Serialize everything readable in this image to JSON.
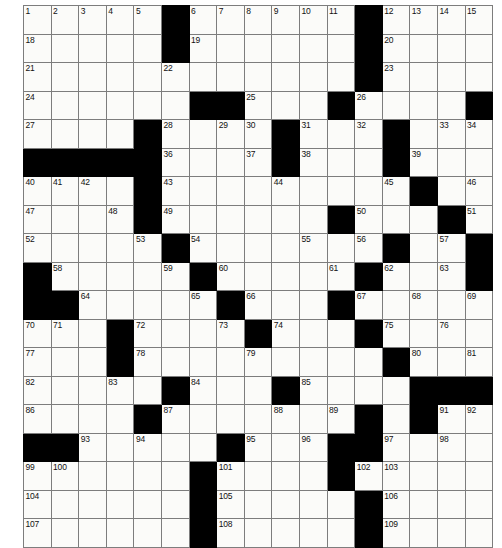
{
  "puzzle": {
    "type": "crossword-grid",
    "rows": 17,
    "cols": 17,
    "cell_size_px": 27.6,
    "colors": {
      "block": "#000000",
      "cell": "#fbfbf9",
      "grid_line": "#7d7d7d",
      "number_text": "#111111",
      "page_background": "#ffffff"
    },
    "max_number": 109,
    "grid": [
      [
        "1",
        "2",
        "3",
        "4",
        "5",
        "#",
        "6",
        "7",
        "8",
        "9",
        "10",
        "11",
        "#",
        "12",
        "13",
        "14",
        "15",
        "16",
        "17"
      ],
      [
        "18",
        "",
        "",
        "",
        "",
        "#",
        "19",
        "",
        "",
        "",
        "",
        "",
        "#",
        "20",
        "",
        "",
        "",
        "",
        ""
      ]
    ],
    "blocks": [
      [
        0,
        5
      ],
      [
        0,
        12
      ],
      [
        1,
        5
      ],
      [
        1,
        12
      ],
      [
        2,
        12
      ],
      [
        3,
        6
      ],
      [
        3,
        7
      ],
      [
        3,
        11
      ],
      [
        3,
        16
      ],
      [
        4,
        4
      ],
      [
        4,
        9
      ],
      [
        4,
        13
      ],
      [
        5,
        0
      ],
      [
        5,
        1
      ],
      [
        5,
        2
      ],
      [
        5,
        3
      ],
      [
        5,
        4
      ],
      [
        5,
        9
      ],
      [
        5,
        13
      ],
      [
        6,
        4
      ],
      [
        6,
        14
      ],
      [
        7,
        4
      ],
      [
        7,
        5
      ],
      [
        7,
        11
      ],
      [
        7,
        14
      ],
      [
        8,
        5
      ],
      [
        8,
        13
      ],
      [
        8,
        16
      ],
      [
        9,
        0
      ],
      [
        9,
        6
      ],
      [
        9,
        12
      ],
      [
        9,
        16
      ],
      [
        10,
        0
      ],
      [
        10,
        1
      ],
      [
        10,
        2
      ],
      [
        10,
        7
      ],
      [
        10,
        11
      ],
      [
        11,
        4
      ],
      [
        11,
        8
      ],
      [
        11,
        12
      ],
      [
        12,
        4
      ],
      [
        12,
        13
      ],
      [
        13,
        6
      ],
      [
        13,
        10
      ],
      [
        13,
        14
      ],
      [
        13,
        15
      ],
      [
        13,
        16
      ],
      [
        14,
        5
      ],
      [
        14,
        12
      ],
      [
        14,
        14
      ],
      [
        15,
        0
      ],
      [
        15,
        1
      ],
      [
        15,
        8
      ],
      [
        15,
        11
      ],
      [
        15,
        12
      ],
      [
        15,
        13
      ],
      [
        16,
        7
      ],
      [
        16,
        14
      ]
    ],
    "numbers": {
      "0": {
        "0": "1",
        "1": "2",
        "2": "3",
        "3": "4",
        "4": "5",
        "6": "6",
        "7": "7",
        "8": "8",
        "9": "9",
        "10": "10",
        "11": "11",
        "13": "12",
        "14": "13",
        "15": "14",
        "16": "15",
        "17": "16",
        "18": "17"
      },
      "1": {
        "0": "18",
        "6": "19",
        "13": "20"
      },
      "2": {
        "0": "21",
        "5": "22",
        "13": "23"
      },
      "3": {
        "0": "24",
        "8": "25",
        "12": "26"
      },
      "4": {
        "0": "27",
        "5": "28",
        "7": "29",
        "8": "30",
        "10": "31",
        "12": "32",
        "15": "33",
        "17": "34",
        "18": "35"
      },
      "5": {
        "5": "36",
        "9": "37",
        "11": "38",
        "14": "39"
      },
      "6": {
        "0": "40",
        "1": "41",
        "2": "42",
        "5": "43",
        "9": "44",
        "13": "45",
        "16": "46"
      },
      "7": {
        "0": "47",
        "3": "48",
        "5": "49",
        "11": "50",
        "16": "51"
      },
      "8": {
        "0": "52",
        "4": "53",
        "6": "54",
        "10": "55",
        "12": "56",
        "15": "57"
      },
      "9": {
        "1": "58",
        "5": "59",
        "7": "60",
        "11": "61",
        "13": "62",
        "17": "63"
      },
      "10": {
        "2": "64",
        "6": "65",
        "8": "66",
        "12": "67",
        "14": "68",
        "18": "69"
      },
      "11": {
        "0": "70",
        "1": "71",
        "4": "72",
        "7": "73",
        "9": "74",
        "13": "75",
        "15": "76"
      },
      "12": {
        "0": "77",
        "4": "78",
        "8": "79",
        "14": "80",
        "16": "81"
      },
      "13": {
        "0": "82",
        "3": "83",
        "6": "84",
        "10": "85"
      },
      "14": {
        "0": "86",
        "5": "87",
        "9": "88",
        "11": "89",
        "15": "90",
        "16": "91",
        "17": "92"
      },
      "15": {
        "2": "93",
        "4": "94",
        "8": "95",
        "10": "96",
        "13": "97",
        "15": "98"
      },
      "16": {
        "0": "99",
        "1": "100",
        "7": "101",
        "11": "102",
        "12": "103"
      },
      "17": {
        "0": "104",
        "7": "105",
        "13": "106"
      },
      "18": {
        "0": "107",
        "7": "108",
        "13": "109"
      }
    },
    "cells": [
      [
        {
          "n": "1"
        },
        {
          "n": "2"
        },
        {
          "n": "3"
        },
        {
          "n": "4"
        },
        {
          "n": "5"
        },
        {
          "b": true
        },
        {
          "n": "6"
        },
        {
          "n": "7"
        },
        {
          "n": "8"
        },
        {
          "n": "9"
        },
        {
          "n": "10"
        },
        {
          "n": "11"
        },
        {
          "b": true
        },
        {
          "n": "12"
        },
        {
          "n": "13"
        },
        {
          "n": "14"
        },
        {
          "n": "15"
        }
      ]
    ],
    "layout": [
      "1 2 3 4 5 . 6 7 8 9 10 11 . 12 13 14 15",
      "note: see cells_flat for authoritative data"
    ],
    "cells_flat": [
      [
        {
          "n": "1"
        },
        {
          "n": "2"
        },
        {
          "n": "3"
        },
        {
          "n": "4"
        },
        {
          "n": "5"
        },
        {
          "b": 1
        },
        {
          "n": "6"
        },
        {
          "n": "7"
        },
        {
          "n": "8"
        },
        {
          "n": "9"
        },
        {
          "n": "10"
        },
        {
          "n": "11"
        },
        {
          "b": 1
        },
        {
          "n": "12"
        },
        {
          "n": "13"
        },
        {
          "n": "14"
        },
        {
          "n": "15"
        },
        {
          "n": "16"
        },
        {
          "n": "17"
        }
      ]
    ],
    "grid_def": {
      "0": {
        "blocks": [
          5,
          12
        ],
        "nums": {
          "0": "1",
          "1": "2",
          "2": "3",
          "3": "4",
          "4": "5",
          "6": "6",
          "7": "7",
          "8": "8",
          "9": "9",
          "10": "10",
          "11": "11",
          "13": "12",
          "14": "13",
          "15": "14",
          "16": "15"
        }
      },
      "1": {
        "blocks": [
          5,
          12
        ],
        "nums": {
          "0": "18",
          "6": "19",
          "13": "20"
        }
      },
      "2": {
        "blocks": [
          12
        ],
        "nums": {
          "0": "21",
          "5": "22",
          "13": "23"
        }
      },
      "3": {
        "blocks": [
          6,
          7,
          11,
          16
        ],
        "nums": {
          "0": "24",
          "8": "25",
          "12": "26"
        }
      },
      "4": {
        "blocks": [
          4,
          9,
          13
        ],
        "nums": {
          "0": "27",
          "5": "28",
          "7": "29",
          "8": "30",
          "10": "31",
          "12": "32",
          "15": "33",
          "16": "34"
        }
      },
      "5": {
        "blocks": [
          0,
          1,
          2,
          3,
          4,
          9,
          13
        ],
        "nums": {
          "5": "36",
          "8": "37",
          "10": "38",
          "14": "39"
        }
      },
      "6": {
        "blocks": [
          4,
          14
        ],
        "nums": {
          "0": "40",
          "1": "41",
          "2": "42",
          "5": "43",
          "9": "44",
          "13": "45",
          "16": "46"
        }
      },
      "7": {
        "blocks": [
          4,
          11,
          15
        ],
        "nums": {
          "0": "47",
          "3": "48",
          "5": "49",
          "12": "50",
          "16": "51"
        }
      },
      "8": {
        "blocks": [
          5,
          13,
          16
        ],
        "nums": {
          "0": "52",
          "4": "53",
          "6": "54",
          "10": "55",
          "12": "56",
          "15": "57"
        }
      },
      "9": {
        "blocks": [
          0,
          6,
          12,
          16
        ],
        "nums": {
          "1": "58",
          "5": "59",
          "7": "60",
          "11": "61",
          "13": "62",
          "15": "63"
        }
      },
      "10": {
        "blocks": [
          0,
          1,
          7,
          11
        ],
        "nums": {
          "2": "64",
          "6": "65",
          "8": "66",
          "12": "67",
          "14": "68",
          "16": "69"
        }
      },
      "11": {
        "blocks": [
          3,
          8,
          12
        ],
        "nums": {
          "0": "70",
          "1": "71",
          "4": "72",
          "7": "73",
          "9": "74",
          "13": "75",
          "15": "76"
        }
      },
      "12": {
        "blocks": [
          3,
          13
        ],
        "nums": {
          "0": "77",
          "4": "78",
          "8": "79",
          "14": "80",
          "16": "81"
        }
      },
      "13": {
        "blocks": [
          5,
          9,
          14,
          15,
          16
        ],
        "nums": {
          "0": "82",
          "3": "83",
          "6": "84",
          "10": "85"
        }
      },
      "14": {
        "blocks": [
          4,
          12,
          14
        ],
        "nums": {
          "0": "86",
          "5": "87",
          "9": "88",
          "11": "89",
          "14": "90",
          "15": "91",
          "16": "92"
        }
      },
      "15": {
        "blocks": [
          0,
          1,
          7,
          11,
          12
        ],
        "nums": {
          "2": "93",
          "4": "94",
          "8": "95",
          "10": "96",
          "13": "97",
          "15": "98"
        }
      },
      "16": {
        "blocks": [
          6,
          11
        ],
        "nums": {
          "0": "99",
          "1": "100",
          "7": "101",
          "12": "102",
          "13": "103"
        }
      },
      "17": {
        "blocks": [
          6,
          12
        ],
        "nums": {
          "0": "104",
          "7": "105",
          "13": "106"
        }
      },
      "18": {
        "blocks": [
          6,
          12
        ],
        "nums": {
          "0": "107",
          "7": "108",
          "13": "109"
        }
      }
    },
    "final_grid": [
      {
        "row": 0,
        "blocks": [
          5,
          12
        ],
        "nums": {
          "0": "1",
          "1": "2",
          "2": "3",
          "3": "4",
          "4": "5",
          "6": "6",
          "7": "7",
          "8": "8",
          "9": "9",
          "10": "10",
          "11": "11",
          "13": "12",
          "14": "13",
          "15": "14",
          "16": "15"
        }
      },
      {
        "row": 1,
        "blocks": [
          5,
          12
        ],
        "nums": {
          "0": "18",
          "6": "19",
          "13": "20"
        }
      },
      {
        "row": 2,
        "blocks": [
          12
        ],
        "nums": {
          "0": "21",
          "5": "22",
          "13": "23"
        }
      },
      {
        "row": 3,
        "blocks": [
          6,
          7,
          11,
          16
        ],
        "nums": {
          "0": "24",
          "8": "25",
          "12": "26"
        }
      },
      {
        "row": 4,
        "blocks": [
          4,
          9,
          13
        ],
        "nums": {
          "0": "27",
          "5": "28",
          "7": "29",
          "8": "30",
          "10": "31",
          "12": "32",
          "15": "33",
          "16": "34"
        }
      },
      {
        "row": 5,
        "blocks": [
          0,
          1,
          2,
          3,
          4,
          9,
          13
        ],
        "nums": {
          "5": "36",
          "8": "37",
          "10": "38",
          "14": "39"
        }
      },
      {
        "row": 6,
        "blocks": [
          4,
          14
        ],
        "nums": {
          "0": "40",
          "1": "41",
          "2": "42",
          "5": "43",
          "9": "44",
          "13": "45",
          "16": "46"
        }
      },
      {
        "row": 7,
        "blocks": [
          4,
          11,
          15
        ],
        "nums": {
          "0": "47",
          "3": "48",
          "5": "49",
          "12": "50",
          "16": "51"
        }
      },
      {
        "row": 8,
        "blocks": [
          5,
          13,
          16
        ],
        "nums": {
          "0": "52",
          "4": "53",
          "6": "54",
          "10": "55",
          "12": "56",
          "15": "57"
        }
      },
      {
        "row": 9,
        "blocks": [
          0,
          6,
          12,
          16
        ],
        "nums": {
          "1": "58",
          "5": "59",
          "7": "60",
          "11": "61",
          "13": "62",
          "15": "63"
        }
      },
      {
        "row": 10,
        "blocks": [
          0,
          1,
          7,
          11
        ],
        "nums": {
          "2": "64",
          "6": "65",
          "8": "66",
          "12": "67",
          "14": "68",
          "16": "69"
        }
      },
      {
        "row": 11,
        "blocks": [
          3,
          8,
          12
        ],
        "nums": {
          "0": "70",
          "1": "71",
          "4": "72",
          "7": "73",
          "9": "74",
          "13": "75",
          "15": "76"
        }
      },
      {
        "row": 12,
        "blocks": [
          3,
          13
        ],
        "nums": {
          "0": "77",
          "4": "78",
          "8": "79",
          "14": "80",
          "16": "81"
        }
      },
      {
        "row": 13,
        "blocks": [
          5,
          9,
          14,
          15,
          16
        ],
        "nums": {
          "0": "82",
          "3": "83",
          "6": "84",
          "10": "85"
        }
      },
      {
        "row": 14,
        "blocks": [
          4,
          12,
          14
        ],
        "nums": {
          "0": "86",
          "5": "87",
          "9": "88",
          "11": "89",
          "14": "90",
          "15": "91",
          "16": "92"
        }
      },
      {
        "row": 15,
        "blocks": [
          0,
          1,
          7,
          11,
          12
        ],
        "nums": {
          "2": "93",
          "4": "94",
          "8": "95",
          "10": "96",
          "13": "97",
          "15": "98"
        }
      },
      {
        "row": 16,
        "blocks": [
          6,
          11
        ],
        "nums": {
          "0": "99",
          "1": "100",
          "7": "101",
          "12": "102",
          "13": "103"
        }
      },
      {
        "row": 17,
        "blocks": [
          6,
          12
        ],
        "nums": {
          "0": "104",
          "7": "105",
          "13": "106"
        }
      },
      {
        "row": 18,
        "blocks": [
          6,
          12
        ],
        "nums": {
          "0": "107",
          "7": "108",
          "13": "109"
        }
      }
    ]
  }
}
